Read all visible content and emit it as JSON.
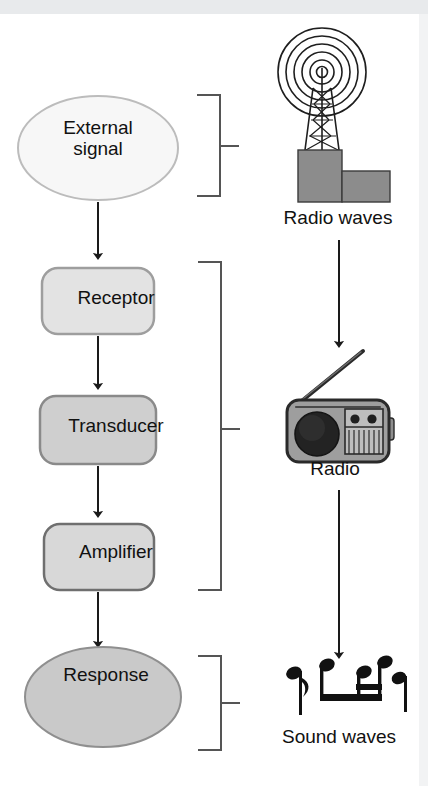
{
  "figure": {
    "type": "flow-diagram",
    "background_color": "#ffffff",
    "top_band_color": "#e8eaec"
  },
  "flow": {
    "nodes": [
      {
        "id": "external-signal",
        "label": "External\nsignal",
        "shape": "ellipse",
        "fill": "#f7f7f7",
        "stroke": "#b8b8b8"
      },
      {
        "id": "receptor",
        "label": "Receptor",
        "shape": "rounded-rect",
        "fill": "#e3e3e3",
        "stroke": "#9a9a9a"
      },
      {
        "id": "transducer",
        "label": "Transducer",
        "shape": "rounded-rect",
        "fill": "#cfcfcf",
        "stroke": "#8a8a8a"
      },
      {
        "id": "amplifier",
        "label": "Amplifier",
        "shape": "rounded-rect",
        "fill": "#d8d8d8",
        "stroke": "#7d7d7d"
      },
      {
        "id": "response",
        "label": "Response",
        "shape": "ellipse",
        "fill": "#c9c9c9",
        "stroke": "#8f8f8f"
      }
    ],
    "arrows": [
      {
        "from": "external-signal",
        "to": "receptor"
      },
      {
        "from": "receptor",
        "to": "transducer"
      },
      {
        "from": "transducer",
        "to": "amplifier"
      },
      {
        "from": "amplifier",
        "to": "response"
      }
    ]
  },
  "brackets": [
    {
      "id": "bracket-signal",
      "groups": [
        "external-signal"
      ],
      "maps_to": "radio-waves"
    },
    {
      "id": "bracket-machinery",
      "groups": [
        "receptor",
        "transducer",
        "amplifier"
      ],
      "maps_to": "radio"
    },
    {
      "id": "bracket-response",
      "groups": [
        "response"
      ],
      "maps_to": "sound-waves"
    }
  ],
  "analogy": {
    "items": [
      {
        "id": "radio-waves",
        "icon": "radio-tower-icon",
        "caption": "Radio waves",
        "tower_fill": "#8c8c8c",
        "wave_stroke": "#222222"
      },
      {
        "id": "radio",
        "icon": "radio-receiver-icon",
        "caption": "Radio",
        "body_fill": "#9e9e9e",
        "speaker_fill": "#232323"
      },
      {
        "id": "sound-waves",
        "icon": "music-notes-icon",
        "caption": "Sound waves",
        "note_fill": "#111111"
      }
    ],
    "arrows": [
      {
        "from": "radio-waves",
        "to": "radio"
      },
      {
        "from": "radio",
        "to": "sound-waves"
      }
    ]
  },
  "colors": {
    "line": "#555555",
    "arrow": "#1a1a1a",
    "text": "#111111",
    "right_strip": "#f2f3f4"
  }
}
